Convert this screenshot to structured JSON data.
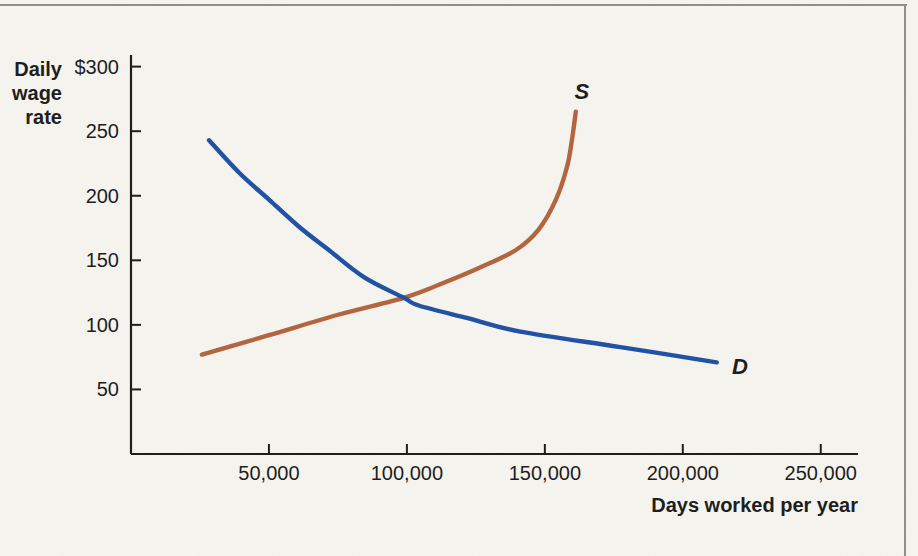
{
  "frame": {
    "background_color": "#f7f5ef",
    "border_color": "#8f8f89"
  },
  "chart_data": {
    "type": "line",
    "title": "",
    "xlabel": "Days worked per year",
    "ylabel": "Daily wage rate",
    "ylabel_lines": [
      "Daily",
      "wage",
      "rate"
    ],
    "xlim": [
      0,
      263500
    ],
    "ylim": [
      0,
      309
    ],
    "grid": false,
    "legend_position": "inline-curve-labels",
    "axis_color": "#1e1e1e",
    "x_ticks": [
      {
        "value": 50000,
        "label": "50,000"
      },
      {
        "value": 100000,
        "label": "100,000"
      },
      {
        "value": 150000,
        "label": "150,000"
      },
      {
        "value": 200000,
        "label": "200,000"
      },
      {
        "value": 250000,
        "label": "250,000"
      }
    ],
    "y_ticks": [
      {
        "value": 300,
        "label": "$300"
      },
      {
        "value": 250,
        "label": "250"
      },
      {
        "value": 200,
        "label": "200"
      },
      {
        "value": 150,
        "label": "150"
      },
      {
        "value": 100,
        "label": "100"
      },
      {
        "value": 50,
        "label": "50"
      }
    ],
    "equilibrium": {
      "days_worked": 99000,
      "daily_wage": 121
    },
    "series": [
      {
        "name": "supply",
        "label": "S",
        "color": "#b2653e",
        "label_at": [
          163400,
          281
        ],
        "points": [
          [
            25700,
            77
          ],
          [
            50000,
            92
          ],
          [
            75400,
            108
          ],
          [
            98900,
            121
          ],
          [
            111600,
            131
          ],
          [
            126100,
            144
          ],
          [
            139500,
            158
          ],
          [
            147800,
            174
          ],
          [
            154000,
            197
          ],
          [
            158000,
            222
          ],
          [
            159800,
            243
          ],
          [
            161200,
            265
          ]
        ]
      },
      {
        "name": "demand",
        "label": "D",
        "color": "#2152a3",
        "label_at": [
          220700,
          68
        ],
        "points": [
          [
            28300,
            243
          ],
          [
            39100,
            218
          ],
          [
            50000,
            197
          ],
          [
            60900,
            176
          ],
          [
            71700,
            158
          ],
          [
            84400,
            137
          ],
          [
            98900,
            121
          ],
          [
            104300,
            115
          ],
          [
            122400,
            105
          ],
          [
            140600,
            95
          ],
          [
            176800,
            83
          ],
          [
            212300,
            71
          ]
        ]
      }
    ]
  }
}
